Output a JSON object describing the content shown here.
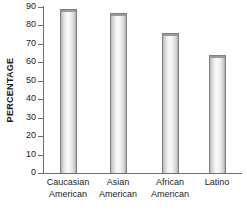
{
  "chart_data": {
    "type": "bar",
    "title": "",
    "xlabel": "",
    "ylabel": "PERCENTAGE",
    "ylim": [
      0,
      90
    ],
    "ytick_step": 10,
    "yticks": [
      90,
      80,
      70,
      60,
      50,
      40,
      30,
      20,
      10,
      0
    ],
    "grid": false,
    "legend": "none",
    "categories": [
      "Caucasian American",
      "Asian American",
      "African American",
      "Latino"
    ],
    "category_lines": [
      {
        "line1": "Caucasian",
        "line2": "American"
      },
      {
        "line1": "Asian",
        "line2": "American"
      },
      {
        "line1": "African",
        "line2": "American"
      },
      {
        "line1": "Latino",
        "line2": ""
      }
    ],
    "values": [
      89,
      87,
      76,
      64
    ],
    "bar_fill_color": "#f0f0f0",
    "bar_border_color": "#808080",
    "axis_color": "#6e6e6e",
    "text_color": "#1a1a1a"
  }
}
